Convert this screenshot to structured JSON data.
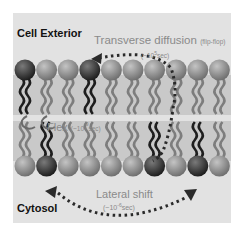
{
  "diagram": {
    "regions": {
      "exterior_label": "Cell Exterior",
      "interior_label": "Cytosol"
    },
    "motions": [
      {
        "name": "Transverse diffusion",
        "qualifier": "(flip-flop)",
        "time_prefix": "(~10",
        "time_exp": "5",
        "time_suffix": "sec)"
      },
      {
        "name": "Flex",
        "time_prefix": "(~10",
        "time_exp": "-9",
        "time_suffix": "sec)"
      },
      {
        "name": "Lateral shift",
        "time_prefix": "(~10",
        "time_exp": "-6",
        "time_suffix": "sec)"
      }
    ],
    "colors": {
      "background": "#e2e2e2",
      "membrane_band": "#c9c9c9",
      "head_light": "#8a8a8a",
      "head_dark": "#3a3a3a",
      "tail_light": "#7d7d7d",
      "tail_dark": "#1e1e1e",
      "arrow": "#2a2a2a",
      "annotation_text": "#8a8a8a"
    },
    "layers": {
      "upper_count": 10,
      "lower_count": 10,
      "upper_dark_indices": [
        0,
        3
      ],
      "lower_dark_indices": [
        1,
        6,
        8
      ]
    }
  }
}
